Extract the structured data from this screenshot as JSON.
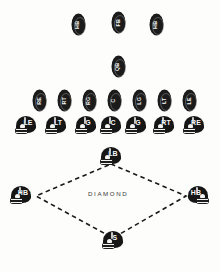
{
  "diagram": {
    "field_label": "DIAMOND",
    "caption": "",
    "colors": {
      "marker": "#1b1b1b",
      "label": "#fafafa",
      "line": "#1a1a1a",
      "background": "#fdfdfc"
    },
    "backfield_row": [
      {
        "label": "HB",
        "x": 72,
        "y": 14
      },
      {
        "label": "FB",
        "x": 112,
        "y": 12
      },
      {
        "label": "HB",
        "x": 150,
        "y": 14
      }
    ],
    "quarterback_row": [
      {
        "label": "QB",
        "x": 112,
        "y": 56
      }
    ],
    "offensive_line_row": [
      {
        "label": "RE",
        "x": 33,
        "y": 90
      },
      {
        "label": "RT",
        "x": 58,
        "y": 90
      },
      {
        "label": "RG",
        "x": 83,
        "y": 90
      },
      {
        "label": "C",
        "x": 108,
        "y": 90
      },
      {
        "label": "LG",
        "x": 133,
        "y": 90
      },
      {
        "label": "LT",
        "x": 158,
        "y": 90
      },
      {
        "label": "LE",
        "x": 183,
        "y": 90
      }
    ],
    "defensive_line_row": [
      {
        "label": "LE",
        "x": 14,
        "y": 116,
        "facing": "right"
      },
      {
        "label": "LT",
        "x": 44,
        "y": 116,
        "facing": "right"
      },
      {
        "label": "G",
        "x": 74,
        "y": 116,
        "facing": "right"
      },
      {
        "label": "C",
        "x": 99,
        "y": 116,
        "facing": "right"
      },
      {
        "label": "G",
        "x": 124,
        "y": 116,
        "facing": "right"
      },
      {
        "label": "RT",
        "x": 152,
        "y": 116,
        "facing": "right"
      },
      {
        "label": "RE",
        "x": 182,
        "y": 116,
        "facing": "right"
      }
    ],
    "secondary": [
      {
        "label": "LB",
        "x": 99,
        "y": 147,
        "role": "linebacker",
        "facing": "right"
      },
      {
        "label": "HB",
        "x": 9,
        "y": 186,
        "role": "left-halfback",
        "facing": "right"
      },
      {
        "label": "HB",
        "x": 186,
        "y": 186,
        "role": "right-halfback",
        "facing": "left"
      },
      {
        "label": "S",
        "x": 99,
        "y": 232,
        "role": "safety",
        "facing": "right"
      }
    ],
    "diamond_path": {
      "top": {
        "x": 111,
        "y": 164
      },
      "right": {
        "x": 186,
        "y": 196
      },
      "bottom": {
        "x": 113,
        "y": 238
      },
      "left": {
        "x": 36,
        "y": 196
      },
      "style": "dashed",
      "label_position": {
        "x": 110,
        "y": 192
      }
    }
  }
}
